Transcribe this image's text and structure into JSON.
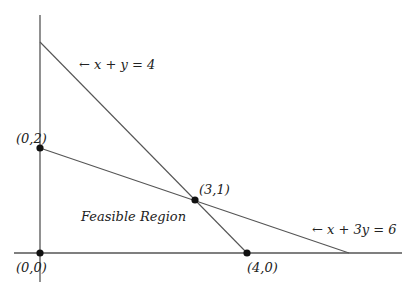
{
  "diagram": {
    "type": "linear-programming-feasible-region",
    "colors": {
      "line": "#555555",
      "point": "#111111",
      "text": "#222222",
      "background": "#ffffff"
    },
    "constraints": [
      {
        "label": "← x + y = 4",
        "equation": "x + y = 4",
        "intercepts": [
          [
            0,
            4
          ],
          [
            4,
            0
          ]
        ]
      },
      {
        "label": "← x + 3y = 6",
        "equation": "x + 3y = 6",
        "intercepts": [
          [
            0,
            2
          ],
          [
            6,
            0
          ]
        ]
      }
    ],
    "points": [
      {
        "label": "(0,2)",
        "x": 0,
        "y": 2
      },
      {
        "label": "(3,1)",
        "x": 3,
        "y": 1
      },
      {
        "label": "(0,0)",
        "x": 0,
        "y": 0
      },
      {
        "label": "(4,0)",
        "x": 4,
        "y": 0
      }
    ],
    "region_label": "Feasible Region"
  }
}
